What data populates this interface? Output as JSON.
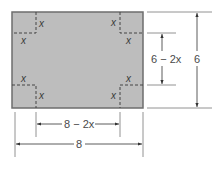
{
  "diagram": {
    "sheet": {
      "width_label": "8",
      "height_label": "6",
      "fill": "#bdbdbd",
      "stroke": "#6e6e6e"
    },
    "corner_labels": {
      "top_left_side": "x",
      "top_left_bottom": "x",
      "top_right_side": "x",
      "top_right_bottom": "x",
      "bottom_left_top": "x",
      "bottom_left_side": "x",
      "bottom_right_top": "x",
      "bottom_right_side": "x"
    },
    "dimensions": {
      "inner_height": "6 − 2x",
      "outer_height": "6",
      "inner_width": "8 − 2x",
      "outer_width": "8"
    }
  }
}
